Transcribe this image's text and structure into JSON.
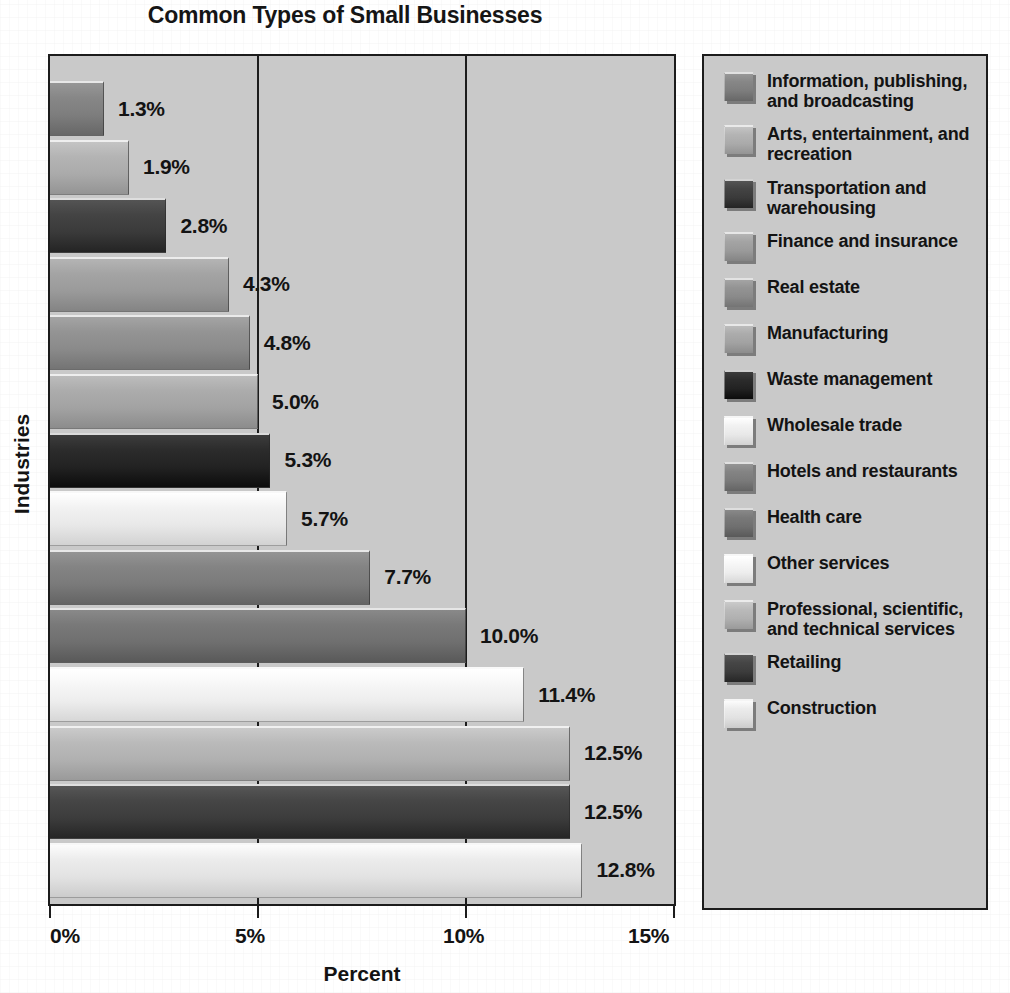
{
  "chart_data": {
    "type": "bar",
    "orientation": "horizontal",
    "title": "Common Types of Small Businesses",
    "xlabel": "Percent",
    "ylabel": "Industries",
    "xlim": [
      0,
      15
    ],
    "xticks": [
      "0%",
      "5%",
      "10%",
      "15%"
    ],
    "xtick_values": [
      0,
      5,
      10,
      15
    ],
    "grid": true,
    "legend_position": "right",
    "categories": [
      "Information, publishing, and broadcasting",
      "Arts, entertainment, and recreation",
      "Transportation and warehousing",
      "Finance and insurance",
      "Real estate",
      "Manufacturing",
      "Waste management",
      "Wholesale trade",
      "Hotels and restaurants",
      "Health care",
      "Other services",
      "Professional, scientific, and technical services",
      "Retailing",
      "Construction"
    ],
    "values": [
      1.3,
      1.9,
      2.8,
      4.3,
      4.8,
      5.0,
      5.3,
      5.7,
      7.7,
      10.0,
      11.4,
      12.5,
      12.5,
      12.8
    ],
    "value_labels": [
      "1.3%",
      "1.9%",
      "2.8%",
      "4.3%",
      "4.8%",
      "5.0%",
      "5.3%",
      "5.7%",
      "7.7%",
      "10.0%",
      "11.4%",
      "12.5%",
      "12.5%",
      "12.8%"
    ],
    "colors": [
      "#7d7d7d",
      "#aaaaaa",
      "#3a3a3a",
      "#9a9a9a",
      "#8a8a8a",
      "#a2a2a2",
      "#222222",
      "#e8e8e8",
      "#7a7a7a",
      "#6f6f6f",
      "#ededed",
      "#b0b0b0",
      "#3c3c3c",
      "#e2e2e2"
    ]
  },
  "legend": {
    "items": [
      {
        "label": "Information, publishing, and broadcasting",
        "color": "#7d7d7d"
      },
      {
        "label": "Arts, entertainment, and recreation",
        "color": "#aaaaaa"
      },
      {
        "label": "Transportation and warehousing",
        "color": "#3a3a3a"
      },
      {
        "label": "Finance and insurance",
        "color": "#9a9a9a"
      },
      {
        "label": "Real estate",
        "color": "#8a8a8a"
      },
      {
        "label": "Manufacturing",
        "color": "#a2a2a2"
      },
      {
        "label": "Waste management",
        "color": "#222222"
      },
      {
        "label": "Wholesale trade",
        "color": "#e8e8e8"
      },
      {
        "label": "Hotels and restaurants",
        "color": "#7a7a7a"
      },
      {
        "label": "Health care",
        "color": "#6f6f6f"
      },
      {
        "label": "Other services",
        "color": "#ededed"
      },
      {
        "label": "Professional, scientific, and technical services",
        "color": "#b0b0b0"
      },
      {
        "label": "Retailing",
        "color": "#3c3c3c"
      },
      {
        "label": "Construction",
        "color": "#e2e2e2"
      }
    ]
  }
}
